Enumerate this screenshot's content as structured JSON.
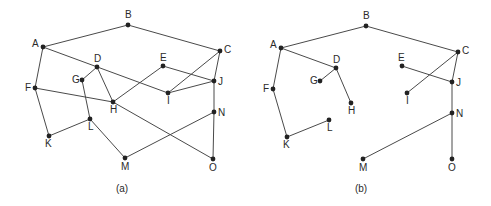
{
  "figure": {
    "graphs": [
      {
        "id": "a",
        "caption": "(a)",
        "caption_pos": [
          122,
          192
        ],
        "nodes": [
          {
            "id": "A",
            "x": 43,
            "y": 47,
            "lx": -11,
            "ly": 0
          },
          {
            "id": "B",
            "x": 128,
            "y": 25,
            "lx": -3,
            "ly": -7
          },
          {
            "id": "C",
            "x": 220,
            "y": 51,
            "lx": 4,
            "ly": 2
          },
          {
            "id": "D",
            "x": 97,
            "y": 67,
            "lx": -3,
            "ly": -5
          },
          {
            "id": "E",
            "x": 163,
            "y": 66,
            "lx": -3,
            "ly": -5
          },
          {
            "id": "F",
            "x": 35,
            "y": 88,
            "lx": -10,
            "ly": 3
          },
          {
            "id": "G",
            "x": 82,
            "y": 80,
            "lx": -10,
            "ly": 3
          },
          {
            "id": "H",
            "x": 113,
            "y": 102,
            "lx": -3,
            "ly": 11
          },
          {
            "id": "I",
            "x": 168,
            "y": 93,
            "lx": -1,
            "ly": 11
          },
          {
            "id": "J",
            "x": 214,
            "y": 81,
            "lx": 4,
            "ly": 4
          },
          {
            "id": "K",
            "x": 49,
            "y": 136,
            "lx": -4,
            "ly": 11
          },
          {
            "id": "L",
            "x": 90,
            "y": 119,
            "lx": -2,
            "ly": 11
          },
          {
            "id": "M",
            "x": 125,
            "y": 158,
            "lx": -4,
            "ly": 12
          },
          {
            "id": "N",
            "x": 214,
            "y": 112,
            "lx": 4,
            "ly": 4
          },
          {
            "id": "O",
            "x": 213,
            "y": 159,
            "lx": -4,
            "ly": 12
          }
        ],
        "edges": [
          [
            "A",
            "B"
          ],
          [
            "B",
            "C"
          ],
          [
            "A",
            "F"
          ],
          [
            "A",
            "I"
          ],
          [
            "C",
            "I"
          ],
          [
            "C",
            "J"
          ],
          [
            "D",
            "G"
          ],
          [
            "D",
            "H"
          ],
          [
            "E",
            "H"
          ],
          [
            "E",
            "J"
          ],
          [
            "I",
            "J"
          ],
          [
            "F",
            "H"
          ],
          [
            "H",
            "O"
          ],
          [
            "G",
            "L"
          ],
          [
            "F",
            "K"
          ],
          [
            "K",
            "L"
          ],
          [
            "L",
            "M"
          ],
          [
            "M",
            "N"
          ],
          [
            "J",
            "N"
          ],
          [
            "N",
            "O"
          ]
        ]
      },
      {
        "id": "b",
        "caption": "(b)",
        "caption_pos": [
          361,
          192
        ],
        "nodes": [
          {
            "id": "A",
            "x": 281,
            "y": 48,
            "lx": -11,
            "ly": 0
          },
          {
            "id": "B",
            "x": 366,
            "y": 26,
            "lx": -3,
            "ly": -7
          },
          {
            "id": "C",
            "x": 458,
            "y": 52,
            "lx": 4,
            "ly": 2
          },
          {
            "id": "D",
            "x": 336,
            "y": 68,
            "lx": -3,
            "ly": -5
          },
          {
            "id": "E",
            "x": 402,
            "y": 66,
            "lx": -4,
            "ly": -5
          },
          {
            "id": "F",
            "x": 273,
            "y": 89,
            "lx": -10,
            "ly": 3
          },
          {
            "id": "G",
            "x": 320,
            "y": 81,
            "lx": -10,
            "ly": 3
          },
          {
            "id": "H",
            "x": 351,
            "y": 103,
            "lx": -3,
            "ly": 11
          },
          {
            "id": "I",
            "x": 407,
            "y": 93,
            "lx": -1,
            "ly": 11
          },
          {
            "id": "J",
            "x": 452,
            "y": 82,
            "lx": 4,
            "ly": 4
          },
          {
            "id": "K",
            "x": 287,
            "y": 137,
            "lx": -4,
            "ly": 11
          },
          {
            "id": "L",
            "x": 329,
            "y": 120,
            "lx": -2,
            "ly": 11
          },
          {
            "id": "M",
            "x": 363,
            "y": 159,
            "lx": -4,
            "ly": 12
          },
          {
            "id": "N",
            "x": 452,
            "y": 113,
            "lx": 4,
            "ly": 4
          },
          {
            "id": "O",
            "x": 452,
            "y": 159,
            "lx": -4,
            "ly": 12
          }
        ],
        "edges": [
          [
            "A",
            "B"
          ],
          [
            "B",
            "C"
          ],
          [
            "A",
            "F"
          ],
          [
            "A",
            "D"
          ],
          [
            "D",
            "G"
          ],
          [
            "D",
            "H"
          ],
          [
            "F",
            "K"
          ],
          [
            "K",
            "L"
          ],
          [
            "C",
            "I"
          ],
          [
            "C",
            "J"
          ],
          [
            "E",
            "J"
          ],
          [
            "J",
            "N"
          ],
          [
            "N",
            "M"
          ],
          [
            "N",
            "O"
          ]
        ]
      }
    ]
  }
}
